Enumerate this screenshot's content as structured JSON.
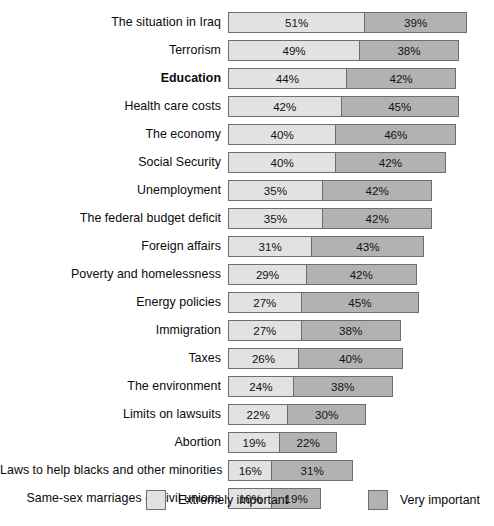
{
  "chart_data": {
    "type": "bar",
    "orientation": "horizontal",
    "stacked": true,
    "title": "",
    "subtitle": "",
    "xlabel": "",
    "ylabel": "",
    "grid": false,
    "xlim": [
      0,
      100
    ],
    "legend_position": "bottom",
    "scale_px_per_percent": 2.655,
    "bar_origin_x_px": 235,
    "categories": [
      "The situation in Iraq",
      "Terrorism",
      "Education",
      "Health care costs",
      "The economy",
      "Social Security",
      "Unemployment",
      "The federal budget deficit",
      "Foreign affairs",
      "Poverty and homelessness",
      "Energy policies",
      "Immigration",
      "Taxes",
      "The environment",
      "Limits on lawsuits",
      "Abortion",
      "Laws to help blacks and other minorities",
      "Same-sex marriages or civil unions"
    ],
    "series": [
      {
        "name": "Extremely important",
        "color": "#e2e2e2",
        "values": [
          51,
          49,
          44,
          42,
          40,
          40,
          35,
          35,
          31,
          29,
          27,
          27,
          26,
          24,
          22,
          19,
          16,
          16
        ],
        "labels": [
          "51%",
          "49%",
          "44%",
          "42%",
          "40%",
          "40%",
          "35%",
          "35%",
          "31%",
          "29%",
          "27%",
          "27%",
          "26%",
          "24%",
          "22%",
          "19%",
          "16%",
          "16%"
        ]
      },
      {
        "name": "Very important",
        "color": "#b2b2b2",
        "values": [
          39,
          38,
          42,
          45,
          46,
          42,
          42,
          42,
          43,
          42,
          45,
          38,
          40,
          38,
          30,
          22,
          31,
          19
        ],
        "labels": [
          "39%",
          "38%",
          "42%",
          "45%",
          "46%",
          "42%",
          "42%",
          "42%",
          "43%",
          "42%",
          "45%",
          "38%",
          "40%",
          "38%",
          "30%",
          "22%",
          "31%",
          "19%"
        ]
      }
    ],
    "emphasized_categories": [
      "Education"
    ],
    "group_break_before": [
      "Abortion"
    ],
    "legend": [
      {
        "label": "Extremely important",
        "color": "#e2e2e2",
        "swatch": "swatch-light"
      },
      {
        "label": "Very important",
        "color": "#b2b2b2",
        "swatch": "swatch-dark"
      }
    ]
  },
  "style": {
    "bar_border_color": "#6e6e6e",
    "background": "#ffffff",
    "text_color": "#0a0a0a"
  }
}
